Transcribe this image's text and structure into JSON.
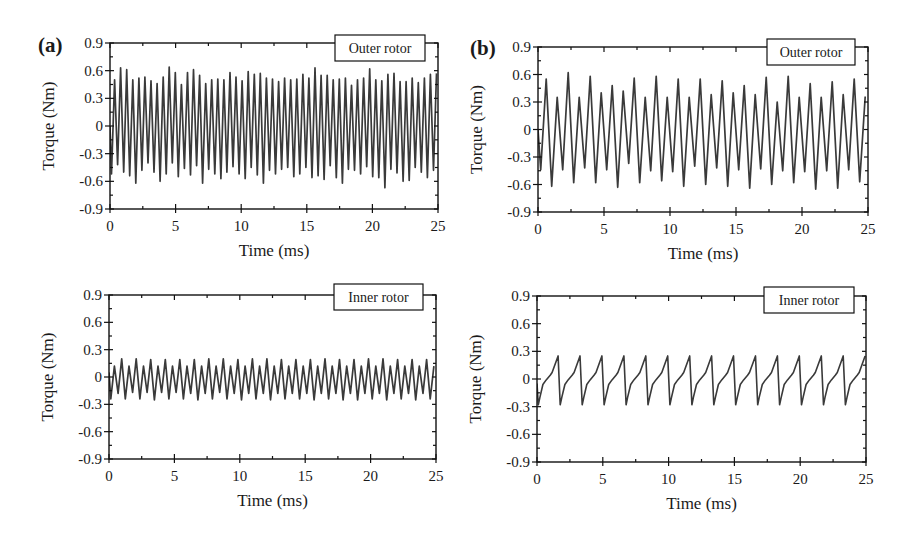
{
  "figure": {
    "panels": [
      {
        "id": "a",
        "label": "(a)"
      },
      {
        "id": "b",
        "label": "(b)"
      }
    ]
  },
  "chart_data": [
    {
      "panel": "(a)",
      "position": "top-left",
      "type": "line",
      "title": "Outer rotor",
      "xlabel": "Time (ms)",
      "ylabel": "Torque (Nm)",
      "xlim": [
        0,
        25
      ],
      "ylim": [
        -0.9,
        0.9
      ],
      "xticks": [
        "0",
        "5",
        "10",
        "15",
        "20",
        "25"
      ],
      "yticks": [
        "0.9",
        "0.6",
        "0.3",
        "0",
        "-0.3",
        "-0.6",
        "-0.9"
      ],
      "grid": false,
      "legend": "boxed label top-right",
      "frame": {
        "x0": 110,
        "x1": 438,
        "y0": 43,
        "y1": 209
      },
      "box": {
        "x": 335,
        "y": 35,
        "w": 90,
        "h": 26
      },
      "series": [
        {
          "name": "Outer rotor torque",
          "waveform": "oscillation",
          "start_value": 0.0,
          "period_ms": 0.463,
          "peaks": [
            0.5,
            0.63,
            0.61,
            0.5,
            0.52,
            0.53,
            0.49,
            0.46,
            0.53,
            0.64,
            0.58,
            0.45,
            0.58,
            0.61,
            0.55,
            0.46,
            0.5,
            0.51,
            0.5,
            0.58,
            0.53,
            0.49,
            0.59,
            0.56,
            0.57,
            0.52,
            0.51,
            0.48,
            0.52,
            0.5,
            0.51,
            0.56,
            0.52,
            0.63,
            0.55,
            0.55,
            0.5,
            0.51,
            0.52,
            0.44,
            0.5,
            0.52,
            0.62,
            0.5,
            0.49,
            0.56,
            0.57,
            0.48,
            0.48,
            0.52,
            0.47,
            0.52,
            0.56,
            0.57,
            0.53,
            0.47,
            0.61,
            0.55,
            0.58,
            0.45
          ],
          "troughs": [
            -0.52,
            -0.42,
            -0.5,
            -0.54,
            -0.62,
            -0.48,
            -0.4,
            -0.5,
            -0.6,
            -0.52,
            -0.4,
            -0.55,
            -0.46,
            -0.53,
            -0.43,
            -0.62,
            -0.47,
            -0.52,
            -0.57,
            -0.5,
            -0.44,
            -0.52,
            -0.57,
            -0.45,
            -0.53,
            -0.62,
            -0.48,
            -0.52,
            -0.47,
            -0.45,
            -0.55,
            -0.52,
            -0.45,
            -0.56,
            -0.54,
            -0.58,
            -0.43,
            -0.56,
            -0.62,
            -0.47,
            -0.48,
            -0.52,
            -0.44,
            -0.55,
            -0.56,
            -0.67,
            -0.47,
            -0.51,
            -0.6,
            -0.59,
            -0.45,
            -0.5,
            -0.56,
            -0.48,
            -0.53,
            -0.51,
            -0.52,
            -0.5,
            -0.45,
            -0.5
          ]
        }
      ]
    },
    {
      "panel": "(b)",
      "position": "top-right",
      "type": "line",
      "title": "Outer rotor",
      "xlabel": "Time (ms)",
      "ylabel": "Torque (Nm)",
      "xlim": [
        0,
        25
      ],
      "ylim": [
        -0.9,
        0.9
      ],
      "xticks": [
        "0",
        "5",
        "10",
        "15",
        "20",
        "25"
      ],
      "yticks": [
        "0.9",
        "0.6",
        "0.3",
        "0",
        "-0.3",
        "-0.6",
        "-0.9"
      ],
      "grid": false,
      "legend": "boxed label top-right",
      "frame": {
        "x0": 538,
        "x1": 868,
        "y0": 47,
        "y1": 212
      },
      "box": {
        "x": 767,
        "y": 39,
        "w": 88,
        "h": 26
      },
      "series": [
        {
          "name": "Outer rotor torque",
          "waveform": "oscillation",
          "start_value": 0.0,
          "period_ms": 0.8333,
          "peaks": [
            0.55,
            0.35,
            0.62,
            0.35,
            0.58,
            0.4,
            0.48,
            0.42,
            0.56,
            0.35,
            0.58,
            0.35,
            0.55,
            0.35,
            0.55,
            0.38,
            0.53,
            0.4,
            0.48,
            0.38,
            0.57,
            0.3,
            0.58,
            0.35,
            0.5,
            0.35,
            0.52,
            0.38,
            0.55,
            0.36
          ],
          "troughs": [
            -0.44,
            -0.62,
            -0.44,
            -0.58,
            -0.42,
            -0.58,
            -0.44,
            -0.63,
            -0.37,
            -0.58,
            -0.45,
            -0.56,
            -0.46,
            -0.62,
            -0.4,
            -0.6,
            -0.42,
            -0.62,
            -0.44,
            -0.64,
            -0.43,
            -0.6,
            -0.45,
            -0.58,
            -0.46,
            -0.65,
            -0.45,
            -0.64,
            -0.44,
            -0.57
          ]
        }
      ]
    },
    {
      "panel": "(a)",
      "position": "bottom-left",
      "type": "line",
      "title": "Inner rotor",
      "xlabel": "Time (ms)",
      "ylabel": "Torque (Nm)",
      "xlim": [
        0,
        25
      ],
      "ylim": [
        -0.9,
        0.9
      ],
      "xticks": [
        "0",
        "5",
        "10",
        "15",
        "20",
        "25"
      ],
      "yticks": [
        "0.9",
        "0.6",
        "0.3",
        "0",
        "-0.3",
        "-0.6",
        "-0.9"
      ],
      "grid": false,
      "legend": "boxed label top-right",
      "frame": {
        "x0": 109,
        "x1": 436,
        "y0": 295,
        "y1": 459
      },
      "box": {
        "x": 334,
        "y": 284,
        "w": 89,
        "h": 26
      },
      "series": [
        {
          "name": "Inner rotor torque",
          "waveform": "oscillation",
          "start_value": 0.05,
          "period_ms": 0.555,
          "peaks": [
            0.12,
            0.2,
            0.12,
            0.2,
            0.12,
            0.19,
            0.12,
            0.19,
            0.12,
            0.19,
            0.12,
            0.19,
            0.12,
            0.2,
            0.12,
            0.2,
            0.12,
            0.19,
            0.12,
            0.2,
            0.12,
            0.2,
            0.12,
            0.19,
            0.12,
            0.19,
            0.12,
            0.19,
            0.12,
            0.2,
            0.12,
            0.19,
            0.12,
            0.19,
            0.12,
            0.2,
            0.12,
            0.2,
            0.12,
            0.19,
            0.12,
            0.19,
            0.12,
            0.19,
            0.12,
            0.17
          ],
          "troughs": [
            -0.24,
            -0.18,
            -0.24,
            -0.17,
            -0.24,
            -0.17,
            -0.25,
            -0.17,
            -0.24,
            -0.17,
            -0.24,
            -0.18,
            -0.25,
            -0.18,
            -0.24,
            -0.17,
            -0.24,
            -0.18,
            -0.25,
            -0.18,
            -0.24,
            -0.18,
            -0.25,
            -0.18,
            -0.24,
            -0.18,
            -0.24,
            -0.18,
            -0.25,
            -0.18,
            -0.24,
            -0.18,
            -0.25,
            -0.18,
            -0.25,
            -0.18,
            -0.24,
            -0.18,
            -0.25,
            -0.18,
            -0.24,
            -0.18,
            -0.25,
            -0.18,
            -0.24,
            -0.18
          ]
        }
      ]
    },
    {
      "panel": "(b)",
      "position": "bottom-right",
      "type": "line",
      "title": "Inner rotor",
      "xlabel": "Time (ms)",
      "ylabel": "Torque (Nm)",
      "xlim": [
        0,
        25
      ],
      "ylim": [
        -0.9,
        0.9
      ],
      "xticks": [
        "0",
        "5",
        "10",
        "15",
        "20",
        "25"
      ],
      "yticks": [
        "0.9",
        "0.6",
        "0.3",
        "0",
        "-0.3",
        "-0.6",
        "-0.9"
      ],
      "grid": false,
      "legend": "boxed label top-right",
      "frame": {
        "x0": 537,
        "x1": 866,
        "y0": 296,
        "y1": 462
      },
      "box": {
        "x": 764,
        "y": 287,
        "w": 90,
        "h": 26
      },
      "series": [
        {
          "name": "Inner rotor torque",
          "waveform": "sawtooth",
          "period_ms": 1.6667,
          "cycles": 15,
          "start_offset_ms": 0.1,
          "cycle_shape": [
            [
              0.0,
              -0.28
            ],
            [
              0.12,
              -0.2
            ],
            [
              0.35,
              -0.06
            ],
            [
              0.6,
              -0.01
            ],
            [
              0.9,
              0.04
            ],
            [
              1.05,
              0.07
            ],
            [
              1.5,
              0.25
            ],
            [
              1.6667,
              -0.28
            ]
          ],
          "peak_value": 0.25,
          "trough_value": -0.28
        }
      ]
    }
  ]
}
